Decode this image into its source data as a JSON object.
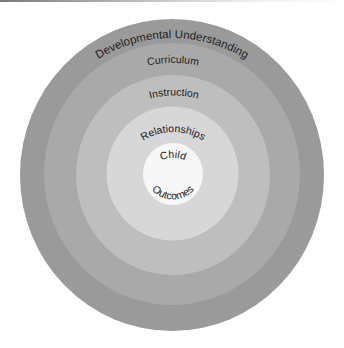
{
  "diagram": {
    "type": "concentric-circles",
    "center": {
      "x": 172,
      "y": 175
    },
    "rings": [
      {
        "id": "developmental-understanding",
        "label": "Developmental Understanding",
        "color": "#9a9a9a",
        "rx": 152,
        "ry": 156
      },
      {
        "id": "curriculum",
        "label": "Curriculum",
        "color": "#a9a9a9",
        "rx": 128,
        "ry": 131
      },
      {
        "id": "instruction",
        "label": "Instruction",
        "color": "#bebebe",
        "rx": 97,
        "ry": 100
      },
      {
        "id": "relationships",
        "label": "Relationships",
        "color": "#d7d7d7",
        "rx": 66,
        "ry": 67
      },
      {
        "id": "child-outcomes",
        "label_top": "Child",
        "label_bottom": "Outcomes",
        "color": "#f7f7f7",
        "rx": 30,
        "ry": 31
      }
    ]
  }
}
